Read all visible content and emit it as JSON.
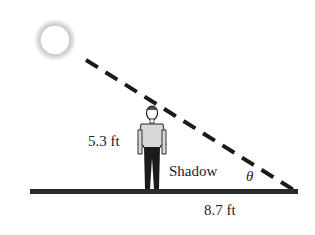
{
  "diagram": {
    "type": "right-triangle-shadow-problem",
    "person_height_label": "5.3 ft",
    "shadow_label": "Shadow",
    "shadow_length_label": "8.7 ft",
    "angle_label": "θ",
    "colors": {
      "line": "#222222",
      "ground": "#2a2a2a",
      "sun_glow": "#bbbbbb"
    }
  }
}
